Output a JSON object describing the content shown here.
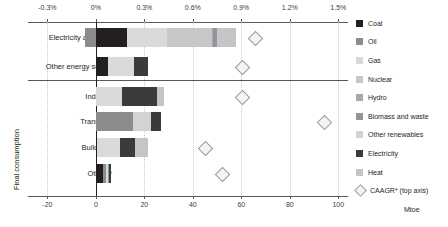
{
  "chart_data": {
    "type": "bar",
    "orientation": "horizontal",
    "title": "",
    "subtitle": "",
    "xlabel": "Mtoe",
    "ylabel": "",
    "secondary_xlabel": "CAAGR* (top axis)",
    "xlim": [
      -28,
      104
    ],
    "secondary_xlim": [
      -0.42,
      1.56
    ],
    "grid": true,
    "legend_position": "right",
    "categories": [
      "Electricity and heat",
      "Other energy sector",
      "Industry",
      "Transport",
      "Buildings",
      "Other**"
    ],
    "group_labels": [
      {
        "label": "Final consumption",
        "categories": [
          "Industry",
          "Transport",
          "Buildings",
          "Other**"
        ]
      }
    ],
    "bottom_axis_ticks": [
      "-20",
      "0",
      "20",
      "40",
      "60",
      "80",
      "100"
    ],
    "bottom_axis_values": [
      -20,
      0,
      20,
      40,
      60,
      80,
      100
    ],
    "top_axis_ticks": [
      "-0.3%",
      "0%",
      "0.3%",
      "0.6%",
      "0.9%",
      "1.2%",
      "1.5%"
    ],
    "top_axis_values": [
      -0.3,
      0,
      0.3,
      0.6,
      0.9,
      1.2,
      1.5
    ],
    "series": [
      {
        "name": "Coal",
        "color": "#231f20",
        "values": [
          13.0,
          5.2,
          0.0,
          0.0,
          0.3,
          2.8
        ]
      },
      {
        "name": "Oil",
        "color": "#8b8c8e",
        "values": [
          -4.6,
          0.0,
          0.0,
          15.2,
          0.0,
          1.2
        ]
      },
      {
        "name": "Gas",
        "color": "#d9dadb",
        "values": [
          16.2,
          10.4,
          10.6,
          0.0,
          9.8,
          1.0
        ]
      },
      {
        "name": "Nuclear",
        "color": "#c6c7c9",
        "values": [
          18.5,
          0.0,
          0.0,
          0.0,
          0.0,
          0.0
        ]
      },
      {
        "name": "Hydro",
        "color": "#a7a9ac",
        "values": [
          0.8,
          0.0,
          0.0,
          0.0,
          0.0,
          0.0
        ]
      },
      {
        "name": "Biomass and waste",
        "color": "#939598",
        "values": [
          1.4,
          0.0,
          0.0,
          0.0,
          0.0,
          0.4
        ]
      },
      {
        "name": "Other renewables",
        "color": "#d2d3d5",
        "values": [
          0.0,
          0.0,
          0.0,
          7.4,
          0.0,
          0.0
        ]
      },
      {
        "name": "Electricity",
        "color": "#3c3b3c",
        "values": [
          0.0,
          6.0,
          14.6,
          4.4,
          6.0,
          0.9
        ]
      },
      {
        "name": "Heat",
        "color": "#c4c5c7",
        "values": [
          8.0,
          0.0,
          3.0,
          0.0,
          5.6,
          0.0
        ]
      }
    ],
    "caagr_marker": {
      "name": "CAAGR* (top axis)",
      "color": "#f4f4f4",
      "edge_color": "#9a9a9a",
      "values": [
        0.98,
        0.9,
        0.9,
        1.41,
        0.67,
        0.78
      ]
    }
  },
  "legend": {
    "items": [
      {
        "label": "Coal",
        "color": "#231f20",
        "shape": "square"
      },
      {
        "label": "Oil",
        "color": "#8b8c8e",
        "shape": "square"
      },
      {
        "label": "Gas",
        "color": "#d9dadb",
        "shape": "square"
      },
      {
        "label": "Nuclear",
        "color": "#c6c7c9",
        "shape": "square"
      },
      {
        "label": "Hydro",
        "color": "#a7a9ac",
        "shape": "square"
      },
      {
        "label": "Biomass and waste",
        "color": "#939598",
        "shape": "square"
      },
      {
        "label": "Other renewables",
        "color": "#d2d3d5",
        "shape": "square"
      },
      {
        "label": "Electricity",
        "color": "#3c3b3c",
        "shape": "square"
      },
      {
        "label": "Heat",
        "color": "#c4c5c7",
        "shape": "square"
      },
      {
        "label": "CAAGR* (top axis)",
        "color": "#f4f4f4",
        "shape": "diamond"
      }
    ]
  },
  "axis_titles": {
    "unit": "Mtoe",
    "vertical_group": "Final consumption"
  }
}
